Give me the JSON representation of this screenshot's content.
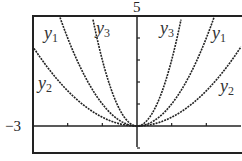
{
  "chart_data": {
    "type": "line",
    "title": "",
    "xlabel": "",
    "ylabel": "",
    "xlim": [
      -3,
      3
    ],
    "ylim": [
      -1,
      5
    ],
    "axis_labels": {
      "x_min": "−3",
      "y_max": "5"
    },
    "ticks": {
      "x": [
        -2,
        -1,
        1,
        2
      ],
      "y": [
        -1,
        1,
        2,
        3,
        4
      ]
    },
    "grid": false,
    "series": [
      {
        "name": "y1",
        "label_main": "y",
        "label_sub": "1",
        "formula": "x^2",
        "coef": 1
      },
      {
        "name": "y2",
        "label_main": "y",
        "label_sub": "2",
        "formula": "0.4x^2",
        "coef": 0.4
      },
      {
        "name": "y3",
        "label_main": "y",
        "label_sub": "3",
        "formula": "3x^2",
        "coef": 3
      }
    ]
  }
}
